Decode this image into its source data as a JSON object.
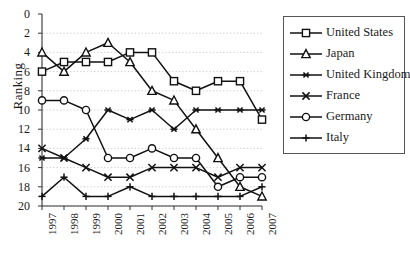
{
  "chart_data": {
    "type": "line",
    "title": "",
    "xlabel": "",
    "ylabel": "Ranking",
    "x": [
      "1997",
      "1998",
      "1999",
      "2000",
      "2001",
      "2002",
      "2003",
      "2004",
      "2005",
      "2006",
      "2007"
    ],
    "xlim": [
      "1997",
      "2007"
    ],
    "ylim": [
      0,
      20
    ],
    "y_inverted": true,
    "yticks": [
      0,
      2,
      4,
      6,
      8,
      10,
      12,
      14,
      16,
      18,
      20
    ],
    "grid": "horizontal-dotted",
    "legend_position": "right-outside",
    "series": [
      {
        "name": "United States",
        "marker": "square",
        "values": [
          6,
          5,
          5,
          5,
          4,
          4,
          7,
          8,
          7,
          7,
          11
        ]
      },
      {
        "name": "Japan",
        "marker": "triangle",
        "values": [
          4,
          6,
          4,
          3,
          5,
          8,
          9,
          12,
          15,
          18,
          19
        ]
      },
      {
        "name": "United Kingdom",
        "marker": "asterisk",
        "values": [
          15,
          15,
          13,
          10,
          11,
          10,
          12,
          10,
          10,
          10,
          10
        ]
      },
      {
        "name": "France",
        "marker": "cross",
        "values": [
          14,
          15,
          16,
          17,
          17,
          16,
          16,
          16,
          17,
          16,
          16
        ]
      },
      {
        "name": "Germany",
        "marker": "circle",
        "values": [
          9,
          9,
          10,
          15,
          15,
          14,
          15,
          15,
          18,
          17,
          17
        ]
      },
      {
        "name": "Italy",
        "marker": "plus",
        "values": [
          19,
          17,
          19,
          19,
          18,
          19,
          19,
          19,
          19,
          19,
          18
        ]
      }
    ]
  },
  "legend": {
    "items": [
      {
        "label": "United States",
        "marker": "square"
      },
      {
        "label": "Japan",
        "marker": "triangle"
      },
      {
        "label": "United Kingdom",
        "marker": "asterisk"
      },
      {
        "label": "France",
        "marker": "cross"
      },
      {
        "label": "Germany",
        "marker": "circle"
      },
      {
        "label": "Italy",
        "marker": "plus"
      }
    ]
  },
  "colors": {
    "line": "#111111",
    "marker_fill": "#ffffff",
    "grid": "#bdbdbd",
    "axis": "#333333",
    "background": "#ffffff"
  }
}
